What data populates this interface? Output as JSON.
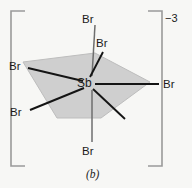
{
  "figure": {
    "caption": "(b)",
    "charge": "−3",
    "center_atom": "Sb",
    "ligand_symbol": "Br",
    "colors": {
      "background": "#f7f7f5",
      "plane_fill": "#cfcfcf",
      "plane_stroke": "#bdbdbd",
      "bond": "#141414",
      "axial_bond": "#6e6e6e",
      "bracket": "#9a9a9a",
      "text": "#1b1b1b"
    },
    "bracket": {
      "left_x": 11,
      "right_x": 162,
      "top_y": 11,
      "bottom_y": 166,
      "serif_length": 14
    },
    "center": {
      "x": 88,
      "y": 83
    },
    "plane_polygon": "23,62 95,53 150,82 101,118 57,118",
    "ligands": [
      {
        "name": "br-axial-top",
        "label": "Br",
        "label_x": 82,
        "label_y": 14,
        "bond": [
          95,
          25,
          92,
          76
        ],
        "style": "axial"
      },
      {
        "name": "br-equatorial-upper-right",
        "label": "Br",
        "label_x": 96,
        "label_y": 38,
        "bond": [
          103,
          52,
          90,
          77
        ],
        "style": "equatorial"
      },
      {
        "name": "br-equatorial-left-upper",
        "label": "Br",
        "label_x": 9,
        "label_y": 61,
        "bond": [
          28,
          68,
          83,
          81
        ],
        "style": "equatorial"
      },
      {
        "name": "br-equatorial-right",
        "label": "Br",
        "label_x": 163,
        "label_y": 79,
        "bond": [
          159,
          84,
          95,
          84
        ],
        "style": "equatorial"
      },
      {
        "name": "br-equatorial-left-lower",
        "label": "Br",
        "label_x": 10,
        "label_y": 107,
        "bond": [
          30,
          110,
          84,
          88
        ],
        "style": "equatorial"
      },
      {
        "name": "br-equatorial-lower-right",
        "label": "",
        "label_x": 0,
        "label_y": 0,
        "bond": [
          93,
          89,
          125,
          119
        ],
        "style": "equatorial"
      },
      {
        "name": "br-axial-bottom",
        "label": "Br",
        "label_x": 82,
        "label_y": 146,
        "bond": [
          92,
          90,
          92,
          142
        ],
        "style": "axial"
      }
    ]
  }
}
